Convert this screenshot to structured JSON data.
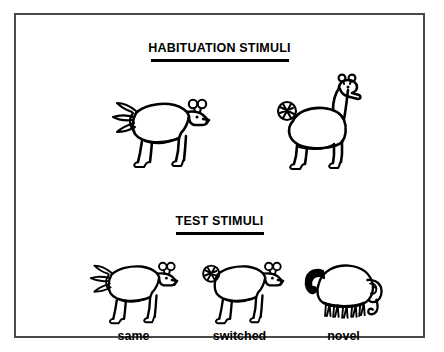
{
  "figure": {
    "background_color": "#ffffff",
    "ink_color": "#000000",
    "frame_color": "#4a4a4a",
    "sections": [
      {
        "id": "habituation",
        "heading": "HABITUATION STIMULI",
        "stimuli": [
          {
            "id": "habituation-goat",
            "name": "goat-fan-tail-figure",
            "label": "",
            "description": "quadruped with feathered fan tail and two round ear-horns"
          },
          {
            "id": "habituation-giraffe",
            "name": "giraffe-scribble-tail-figure",
            "label": "",
            "description": "long-necked quadruped with scribbled round puff tail and two knob horns"
          }
        ]
      },
      {
        "id": "test",
        "heading": "TEST STIMULI",
        "stimuli": [
          {
            "id": "test-same",
            "name": "same-figure",
            "label": "same",
            "description": "quadruped with feathered fan tail and two round ear-horns"
          },
          {
            "id": "test-switched",
            "name": "switched-figure",
            "label": "switched",
            "description": "quadruped body with scribbled round puff tail swapped in"
          },
          {
            "id": "test-novel",
            "name": "novel-figure",
            "label": "novel",
            "description": "elephant-like animal with curled black tail, fringe legs and trunk"
          }
        ]
      }
    ]
  }
}
